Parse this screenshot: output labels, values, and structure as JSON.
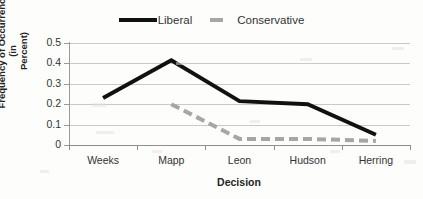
{
  "chart_data": {
    "type": "line",
    "title": "",
    "xlabel": "Decision",
    "ylabel": "Frequency of Occurrence (in Percent)",
    "ylabel_line1": "Frequency of Occurrence (in",
    "ylabel_line2": "Percent)",
    "categories": [
      "Weeks",
      "Mapp",
      "Leon",
      "Hudson",
      "Herring"
    ],
    "ylim": [
      0,
      0.5
    ],
    "ytick_labels": [
      "0.5",
      "0.4",
      "0.3",
      "0.2",
      "0.1",
      "0"
    ],
    "ytick_values": [
      0.5,
      0.4,
      0.3,
      0.2,
      0.1,
      0
    ],
    "grid": "horizontal",
    "legend_position": "top-center",
    "series": [
      {
        "name": "Liberal",
        "style": "solid",
        "color": "#111111",
        "width": 4,
        "values": [
          0.23,
          0.415,
          0.215,
          0.2,
          0.05
        ]
      },
      {
        "name": "Conservative",
        "style": "dashed",
        "color": "#a6a6a6",
        "width": 4,
        "values": [
          null,
          0.2,
          0.03,
          0.03,
          0.02
        ]
      }
    ]
  },
  "legend": {
    "liberal_label": "Liberal",
    "conservative_label": "Conservative"
  },
  "axes": {
    "x_title": "Decision",
    "y_title_line1": "Frequency of Occurrence (in",
    "y_title_line2": "Percent)"
  }
}
